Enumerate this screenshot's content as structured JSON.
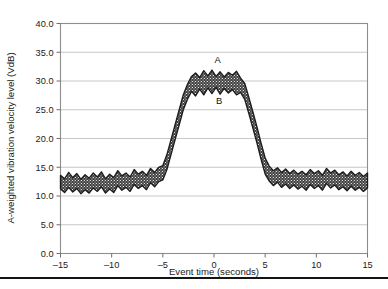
{
  "chart_data": {
    "type": "area",
    "title": "",
    "subtitle": "",
    "xlabel": "Event time (seconds)",
    "ylabel": "A-weighted vibration velocity level (VdB)",
    "xlim": [
      -15,
      15
    ],
    "ylim": [
      0,
      40
    ],
    "xticks": [
      -15,
      -10,
      -5,
      0,
      5,
      10,
      15
    ],
    "xtick_labels": [
      "–15",
      "–10",
      "–5",
      "0",
      "5",
      "10",
      "15"
    ],
    "yticks": [
      0,
      5,
      10,
      15,
      20,
      25,
      30,
      35,
      40
    ],
    "ytick_labels": [
      "0.0",
      "5.0",
      "10.0",
      "15.0",
      "20.0",
      "25.0",
      "30.0",
      "35.0",
      "40.0"
    ],
    "grid": "horizontal",
    "legend": "none",
    "band_fill_color": "#4a4a4a",
    "band_outline_color": "#1c1c1c",
    "gridline_color": "#b9b9b9",
    "frame_color": "#8e8e8e",
    "annotations": [
      {
        "label": "A",
        "x": 0.35,
        "y": 33.2,
        "describes": "upper bound of vibration velocity band at event peak"
      },
      {
        "label": "B",
        "x": 0.5,
        "y": 26.0,
        "describes": "lower bound of vibration velocity band at event peak"
      }
    ],
    "series": [
      {
        "name": "A",
        "role": "upper-bound",
        "x": [
          -15.0,
          -14.6,
          -14.2,
          -13.8,
          -13.4,
          -13.0,
          -12.6,
          -12.2,
          -11.8,
          -11.4,
          -11.0,
          -10.6,
          -10.2,
          -9.8,
          -9.4,
          -9.0,
          -8.6,
          -8.2,
          -7.8,
          -7.4,
          -7.0,
          -6.6,
          -6.2,
          -5.8,
          -5.4,
          -5.0,
          -4.6,
          -4.2,
          -3.8,
          -3.4,
          -3.0,
          -2.6,
          -2.2,
          -1.8,
          -1.4,
          -1.0,
          -0.6,
          -0.2,
          0.2,
          0.6,
          1.0,
          1.4,
          1.8,
          2.2,
          2.6,
          3.0,
          3.4,
          3.8,
          4.2,
          4.6,
          5.0,
          5.4,
          5.8,
          6.2,
          6.6,
          7.0,
          7.4,
          7.8,
          8.2,
          8.6,
          9.0,
          9.4,
          9.8,
          10.2,
          10.6,
          11.0,
          11.4,
          11.8,
          12.2,
          12.6,
          13.0,
          13.4,
          13.8,
          14.2,
          14.6,
          15.0
        ],
        "values": [
          13.6,
          13.0,
          14.1,
          13.2,
          13.9,
          12.9,
          13.7,
          13.1,
          14.0,
          13.3,
          14.2,
          13.0,
          13.8,
          13.2,
          14.4,
          13.5,
          14.0,
          13.3,
          14.6,
          13.8,
          14.3,
          13.6,
          14.8,
          14.1,
          15.0,
          15.3,
          17.2,
          19.8,
          22.4,
          25.0,
          27.6,
          29.4,
          30.8,
          31.4,
          30.6,
          31.8,
          30.9,
          31.9,
          30.8,
          31.6,
          30.7,
          31.5,
          31.0,
          31.7,
          30.5,
          29.6,
          27.2,
          24.6,
          22.0,
          19.2,
          16.6,
          15.2,
          14.4,
          14.9,
          14.1,
          14.7,
          13.9,
          14.5,
          13.8,
          14.3,
          13.7,
          14.6,
          13.9,
          14.4,
          13.6,
          14.8,
          14.0,
          14.5,
          13.7,
          14.2,
          13.5,
          14.3,
          13.6,
          14.1,
          13.4,
          14.0
        ]
      },
      {
        "name": "B",
        "role": "lower-bound",
        "x": [
          -15.0,
          -14.6,
          -14.2,
          -13.8,
          -13.4,
          -13.0,
          -12.6,
          -12.2,
          -11.8,
          -11.4,
          -11.0,
          -10.6,
          -10.2,
          -9.8,
          -9.4,
          -9.0,
          -8.6,
          -8.2,
          -7.8,
          -7.4,
          -7.0,
          -6.6,
          -6.2,
          -5.8,
          -5.4,
          -5.0,
          -4.6,
          -4.2,
          -3.8,
          -3.4,
          -3.0,
          -2.6,
          -2.2,
          -1.8,
          -1.4,
          -1.0,
          -0.6,
          -0.2,
          0.2,
          0.6,
          1.0,
          1.4,
          1.8,
          2.2,
          2.6,
          3.0,
          3.4,
          3.8,
          4.2,
          4.6,
          5.0,
          5.4,
          5.8,
          6.2,
          6.6,
          7.0,
          7.4,
          7.8,
          8.2,
          8.6,
          9.0,
          9.4,
          9.8,
          10.2,
          10.6,
          11.0,
          11.4,
          11.8,
          12.2,
          12.6,
          13.0,
          13.4,
          13.8,
          14.2,
          14.6,
          15.0
        ],
        "values": [
          11.2,
          10.6,
          11.5,
          10.7,
          11.3,
          10.4,
          11.1,
          10.5,
          11.4,
          10.8,
          11.6,
          10.5,
          11.2,
          10.6,
          11.8,
          11.0,
          11.5,
          10.8,
          12.0,
          11.3,
          11.8,
          11.1,
          12.3,
          11.6,
          12.5,
          12.8,
          14.6,
          17.2,
          19.8,
          22.4,
          25.0,
          26.8,
          28.2,
          27.4,
          28.6,
          27.6,
          28.8,
          27.8,
          28.9,
          27.7,
          28.7,
          27.9,
          28.5,
          27.6,
          28.0,
          26.8,
          24.4,
          21.8,
          19.2,
          16.4,
          13.8,
          12.6,
          11.8,
          12.4,
          11.5,
          12.1,
          11.3,
          11.9,
          11.2,
          11.7,
          11.0,
          12.0,
          11.3,
          11.8,
          11.0,
          12.2,
          11.4,
          11.9,
          11.1,
          11.6,
          10.9,
          11.7,
          11.0,
          11.5,
          10.8,
          11.4
        ]
      }
    ]
  },
  "axes": {
    "x_title": "Event time (seconds)",
    "y_title": "A-weighted vibration velocity level (VdB)"
  }
}
